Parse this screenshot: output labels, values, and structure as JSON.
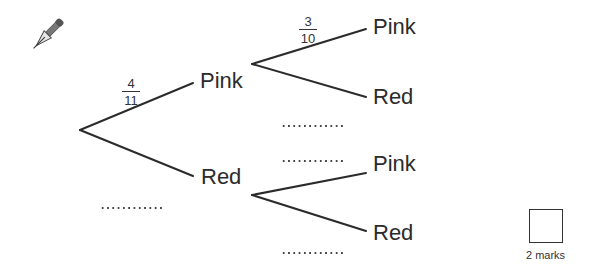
{
  "diagram": {
    "type": "probability-tree",
    "level1": {
      "branches": [
        {
          "label": "Pink",
          "probability": {
            "numerator": "4",
            "denominator": "11"
          }
        },
        {
          "label": "Red",
          "probability_blank": "............"
        }
      ]
    },
    "level2": {
      "after_pink": {
        "branches": [
          {
            "label": "Pink",
            "probability": {
              "numerator": "3",
              "denominator": "10"
            }
          },
          {
            "label": "Red",
            "probability_blank": "............"
          }
        ]
      },
      "after_red": {
        "branches": [
          {
            "label": "Pink",
            "probability_blank": "............"
          },
          {
            "label": "Red",
            "probability_blank": "............"
          }
        ]
      }
    }
  },
  "labels": {
    "l1_pink": "Pink",
    "l1_red": "Red",
    "l2a_pink": "Pink",
    "l2a_red": "Red",
    "l2b_pink": "Pink",
    "l2b_red": "Red"
  },
  "fractions": {
    "f1": {
      "num": "4",
      "den": "11"
    },
    "f2": {
      "num": "3",
      "den": "10"
    }
  },
  "marks": {
    "label": "2 marks"
  },
  "icons": {
    "pen": "pen-nib-icon"
  },
  "colors": {
    "line": "#2b2b2b",
    "text": "#2b2b2b",
    "background": "#ffffff"
  }
}
